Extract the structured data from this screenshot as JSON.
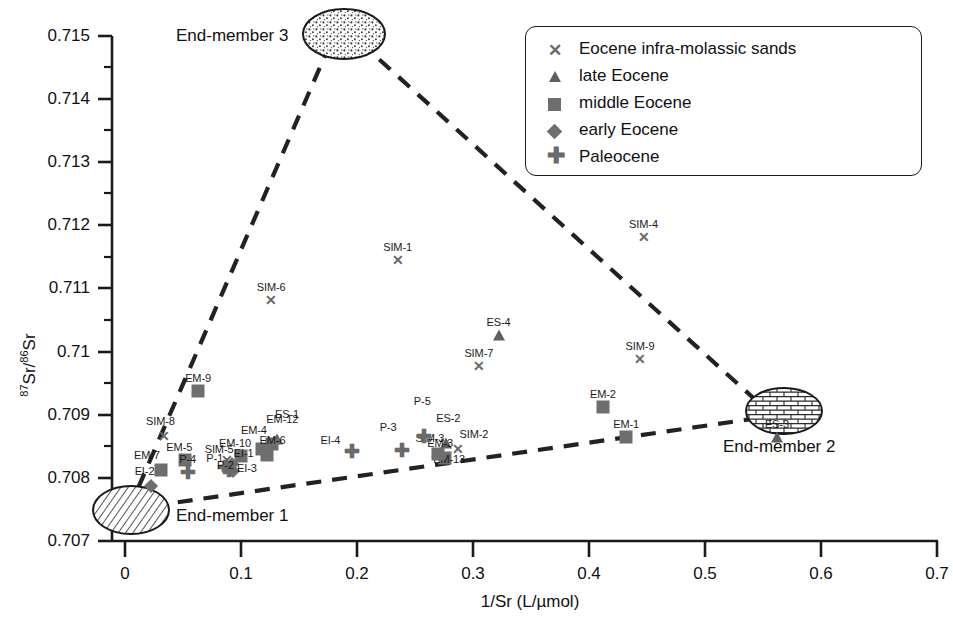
{
  "chart_data": {
    "type": "scatter",
    "title": "",
    "xlabel": "1/Sr (L/µmol)",
    "ylabel": "87Sr/86Sr",
    "ylabel_parts": {
      "sup1": "87",
      "mid": "Sr/",
      "sup2": "86",
      "end": "Sr"
    },
    "xlim": [
      0,
      0.7
    ],
    "ylim": [
      0.707,
      0.715
    ],
    "xticks": [
      "0",
      "0.1",
      "0.2",
      "0.3",
      "0.4",
      "0.5",
      "0.6",
      "0.7"
    ],
    "xtick_values": [
      0,
      0.1,
      0.2,
      0.3,
      0.4,
      0.5,
      0.6,
      0.7
    ],
    "yticks": [
      "0.707",
      "0.708",
      "0.709",
      "0.71",
      "0.711",
      "0.712",
      "0.713",
      "0.714",
      "0.715"
    ],
    "ytick_values": [
      0.707,
      0.708,
      0.709,
      0.71,
      0.711,
      0.712,
      0.713,
      0.714,
      0.715
    ],
    "minor_ticks": true,
    "grid": false,
    "legend_position": "top-right",
    "series": [
      {
        "name": "Eocene infra-molassic sands",
        "marker": "cross",
        "color": "#6a6a6a",
        "points": [
          {
            "label": "SIM-1",
            "x": 0.235,
            "y": 0.71145
          },
          {
            "label": "SIM-6",
            "x": 0.126,
            "y": 0.71082
          },
          {
            "label": "SIM-4",
            "x": 0.447,
            "y": 0.71182
          },
          {
            "label": "SIM-7",
            "x": 0.305,
            "y": 0.70978
          },
          {
            "label": "SIM-9",
            "x": 0.444,
            "y": 0.70989
          },
          {
            "label": "SIM-8",
            "x": 0.034,
            "y": 0.70866
          },
          {
            "label": "SIM-2",
            "x": 0.287,
            "y": 0.70846
          },
          {
            "label": "SIM-3",
            "x": 0.268,
            "y": 0.7084
          },
          {
            "label": "SIM-5",
            "x": 0.088,
            "y": 0.70829
          }
        ]
      },
      {
        "name": "late Eocene",
        "marker": "triangle",
        "color": "#5f5f5f",
        "points": [
          {
            "label": "ES-4",
            "x": 0.322,
            "y": 0.71027
          },
          {
            "label": "ES-3",
            "x": 0.562,
            "y": 0.70864
          },
          {
            "label": "ES-2",
            "x": 0.277,
            "y": 0.70856
          },
          {
            "label": "ES-1",
            "x": 0.131,
            "y": 0.70862
          }
        ]
      },
      {
        "name": "middle Eocene",
        "marker": "square",
        "color": "#6e6e6e",
        "points": [
          {
            "label": "EM-9",
            "x": 0.063,
            "y": 0.70937
          },
          {
            "label": "EM-2",
            "x": 0.412,
            "y": 0.70913
          },
          {
            "label": "EM-1",
            "x": 0.432,
            "y": 0.70864
          },
          {
            "label": "EM-5",
            "x": 0.052,
            "y": 0.70829
          },
          {
            "label": "EM-7",
            "x": 0.031,
            "y": 0.70813
          },
          {
            "label": "EM-4",
            "x": 0.118,
            "y": 0.70846
          },
          {
            "label": "EM-12",
            "x": 0.127,
            "y": 0.70853
          },
          {
            "label": "EM-6",
            "x": 0.122,
            "y": 0.70836
          },
          {
            "label": "EM-13",
            "x": 0.276,
            "y": 0.70832
          },
          {
            "label": "EM-3",
            "x": 0.27,
            "y": 0.70838
          },
          {
            "label": "EM-10",
            "x": 0.1,
            "y": 0.70834
          }
        ]
      },
      {
        "name": "early Eocene",
        "marker": "diamond",
        "color": "#6e6e6e",
        "points": [
          {
            "label": "EI-2",
            "x": 0.022,
            "y": 0.70787
          },
          {
            "label": "EI-1",
            "x": 0.092,
            "y": 0.70822
          },
          {
            "label": "EI-3",
            "x": 0.093,
            "y": 0.70811
          }
        ]
      },
      {
        "name": "Paleocene",
        "marker": "plus",
        "color": "#6a6a6a",
        "points": [
          {
            "label": "P-4",
            "x": 0.054,
            "y": 0.70809
          },
          {
            "label": "P-3",
            "x": 0.239,
            "y": 0.70844
          },
          {
            "label": "P-5",
            "x": 0.258,
            "y": 0.70866
          },
          {
            "label": "EI-4",
            "x": 0.196,
            "y": 0.70843
          },
          {
            "label": "P-1",
            "x": 0.086,
            "y": 0.70818
          },
          {
            "label": "P-2",
            "x": 0.09,
            "y": 0.70812
          }
        ]
      }
    ],
    "end_members": [
      {
        "id": 1,
        "label": "End-member 1",
        "x": 0.013,
        "y": 0.70735,
        "fill": "hatch-diagonal",
        "label_dx": 46,
        "label_dy": 8
      },
      {
        "id": 2,
        "label": "End-member 2",
        "x": 0.666,
        "y": 0.70887,
        "fill": "brick",
        "label_dx": 10,
        "label_dy": 42
      },
      {
        "id": 3,
        "label": "End-member 3",
        "x": 0.222,
        "y": 0.71488,
        "fill": "stipple",
        "label_dx": -42,
        "label_dy": 0
      }
    ],
    "mixing_lines": [
      {
        "from": 3,
        "to": 1,
        "style": "dashed"
      },
      {
        "from": 3,
        "to": 2,
        "style": "dashed"
      },
      {
        "from": 1,
        "to": 2,
        "style": "dashed"
      }
    ],
    "annotations": []
  },
  "legend": {
    "entries": [
      {
        "glyph": "cross-marker-icon",
        "label": "Eocene infra-molassic sands"
      },
      {
        "glyph": "triangle-marker-icon",
        "label": "late Eocene"
      },
      {
        "glyph": "square-marker-icon",
        "label": "middle Eocene"
      },
      {
        "glyph": "diamond-marker-icon",
        "label": "early Eocene"
      },
      {
        "glyph": "plus-marker-icon",
        "label": "Paleocene"
      }
    ]
  },
  "colors": {
    "axis": "#1a1a1a",
    "marker_gray": "#6e6e6e",
    "background": "#ffffff",
    "dash": "#222222"
  }
}
